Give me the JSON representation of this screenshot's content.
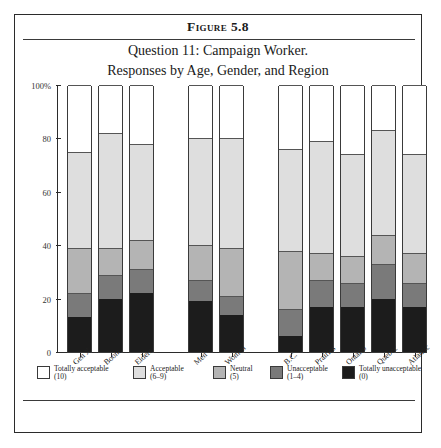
{
  "figure": {
    "label": "Figure 5.8",
    "subtitle_line1": "Question 11: Campaign Worker.",
    "subtitle_line2": "Responses by Age, Gender, and Region"
  },
  "chart_data": {
    "type": "bar",
    "subtype": "stacked-bar-percent",
    "title": "Question 11: Campaign Worker. Responses by Age, Gender, and Region",
    "xlabel": "",
    "ylabel": "",
    "ylim": [
      0,
      100
    ],
    "yticks": [
      0,
      20,
      40,
      60,
      80,
      100
    ],
    "ytick_labels": [
      "0",
      "20",
      "40",
      "60",
      "80",
      "100%"
    ],
    "grid": false,
    "legend_position": "bottom",
    "groups": [
      {
        "name": "Age",
        "categories": [
          "Gen X",
          "Boom",
          "Elders"
        ]
      },
      {
        "name": "Gender",
        "categories": [
          "Men",
          "Women"
        ]
      },
      {
        "name": "Region",
        "categories": [
          "B.C.",
          "Prairies",
          "Ontario",
          "Quebec",
          "Atlantic"
        ]
      }
    ],
    "categories": [
      "Gen X",
      "Boom",
      "Elders",
      "Men",
      "Women",
      "B.C.",
      "Prairies",
      "Ontario",
      "Quebec",
      "Atlantic"
    ],
    "series": [
      {
        "name": "Totally unacceptable (0)",
        "key": "totally_unacceptable",
        "color": "#1c1c1c",
        "values": [
          13,
          20,
          22,
          19,
          14,
          6,
          17,
          17,
          20,
          17
        ]
      },
      {
        "name": "Unacceptable (1–4)",
        "key": "unacceptable",
        "color": "#7a7a7a",
        "values": [
          9,
          9,
          9,
          8,
          7,
          10,
          10,
          9,
          13,
          9
        ]
      },
      {
        "name": "Neutral (5)",
        "key": "neutral",
        "color": "#b4b4b4",
        "values": [
          17,
          10,
          11,
          13,
          18,
          22,
          10,
          10,
          11,
          11
        ]
      },
      {
        "name": "Acceptable (6–9)",
        "key": "acceptable",
        "color": "#dedede",
        "values": [
          36,
          43,
          36,
          40,
          41,
          38,
          42,
          38,
          39,
          37
        ]
      },
      {
        "name": "Totally acceptable (10)",
        "key": "totally_acceptable",
        "color": "#ffffff",
        "values": [
          25,
          18,
          22,
          20,
          20,
          24,
          21,
          26,
          17,
          26
        ]
      }
    ]
  },
  "legend": {
    "items": [
      {
        "line1": "Totally acceptable",
        "line2": "(10)",
        "color": "#ffffff"
      },
      {
        "line1": "Acceptable",
        "line2": "(6–9)",
        "color": "#dedede"
      },
      {
        "line1": "Neutral",
        "line2": "(5)",
        "color": "#b4b4b4"
      },
      {
        "line1": "Unacceptable",
        "line2": "(1–4)",
        "color": "#7a7a7a"
      },
      {
        "line1": "Totally unacceptable",
        "line2": "(0)",
        "color": "#1c1c1c"
      }
    ]
  }
}
